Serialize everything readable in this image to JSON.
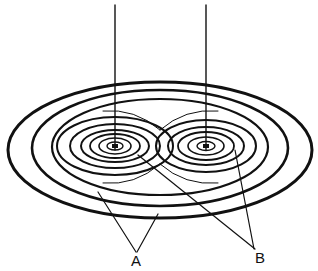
{
  "diagram": {
    "labels": {
      "a": "A",
      "b": "B"
    },
    "colors": {
      "line": "#111111",
      "background": "#ffffff"
    }
  }
}
